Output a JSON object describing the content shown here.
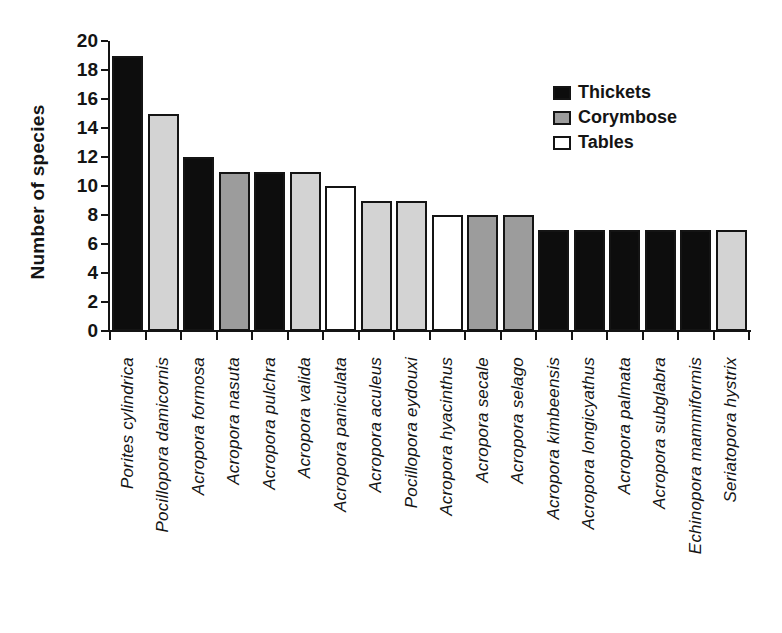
{
  "chart_data": {
    "type": "bar",
    "title": "",
    "xlabel": "",
    "ylabel": "Number of species",
    "ylim": [
      0,
      20
    ],
    "yticks": [
      0,
      2,
      4,
      6,
      8,
      10,
      12,
      14,
      16,
      18,
      20
    ],
    "grid": false,
    "categories": [
      "Porites cylindrica",
      "Pocillopora damicornis",
      "Acropora formosa",
      "Acropora nasuta",
      "Acropora pulchra",
      "Acropora valida",
      "Acropora paniculata",
      "Acropora aculeus",
      "Pocillopora eydouxi",
      "Acropora hyacinthus",
      "Acropora secale",
      "Acropora selago",
      "Acropora kimbeensis",
      "Acropora longicyathus",
      "Acropora palmata",
      "Acropora subglabra",
      "Echinopora mammiformis",
      "Seriatopora hystrix"
    ],
    "values": [
      19,
      15,
      12,
      11,
      11,
      11,
      10,
      9,
      9,
      8,
      8,
      8,
      7,
      7,
      7,
      7,
      7,
      7
    ],
    "bar_fills": [
      "#0d0d0d",
      "#d3d3d3",
      "#0d0d0d",
      "#9c9c9c",
      "#0d0d0d",
      "#d3d3d3",
      "#ffffff",
      "#d3d3d3",
      "#d3d3d3",
      "#ffffff",
      "#9c9c9c",
      "#9c9c9c",
      "#0d0d0d",
      "#0d0d0d",
      "#0d0d0d",
      "#0d0d0d",
      "#0d0d0d",
      "#d3d3d3"
    ],
    "bar_groups": [
      "Thickets",
      "Corymbose",
      "Thickets",
      "Corymbose",
      "Thickets",
      "Corymbose",
      "Tables",
      "Corymbose",
      "Corymbose",
      "Tables",
      "Corymbose",
      "Corymbose",
      "Thickets",
      "Thickets",
      "Thickets",
      "Thickets",
      "Thickets",
      "Corymbose"
    ],
    "legend": {
      "position": "top-right",
      "entries": [
        {
          "label": "Thickets",
          "color": "#0d0d0d"
        },
        {
          "label": "Corymbose",
          "color": "#9c9c9c"
        },
        {
          "label": "Tables",
          "color": "#ffffff"
        }
      ]
    }
  }
}
